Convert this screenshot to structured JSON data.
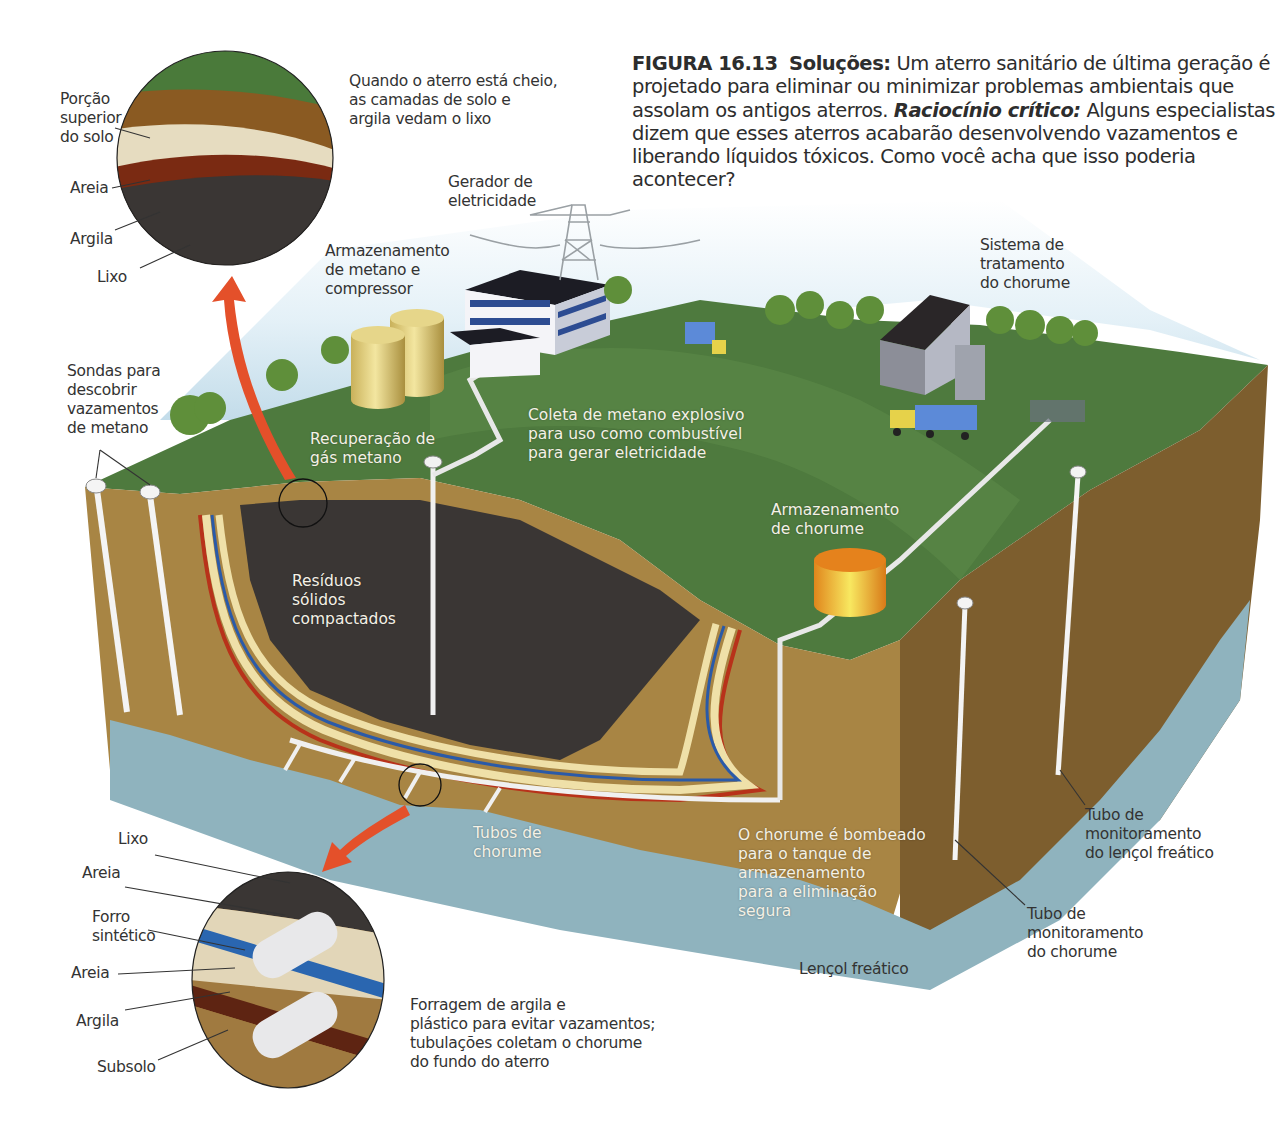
{
  "caption": {
    "figure_number": "FIGURA 16.13",
    "title": "Soluções:",
    "text_1": "Um aterro sanitário de última geração é projetado para eliminar ou minimizar problemas ambientais que assolam os antigos aterros.",
    "critical_label": "Raciocínio crítico:",
    "text_2": "Alguns especialistas dizem que esses aterros acabarão desenvolvendo vazamentos e liberando líquidos tóxicos. Como você acha que isso poderia acontecer?"
  },
  "top_inset": {
    "description": "Quando o aterro está cheio,\nas camadas de solo e\nargila vedam o lixo",
    "layers": [
      {
        "label": "Porção\nsuperior\ndo solo",
        "color": "#8a5a22"
      },
      {
        "label": "Areia",
        "color": "#e6dcc0"
      },
      {
        "label": "Argila",
        "color": "#7a2a12"
      },
      {
        "label": "Lixo",
        "color": "#3a3634"
      }
    ]
  },
  "bottom_inset": {
    "description": "Forragem de argila e\nplástico para evitar vazamentos;\ntubulações coletam o chorume\ndo fundo do aterro",
    "layers": [
      {
        "label": "Lixo",
        "color": "#3a3634"
      },
      {
        "label": "Areia",
        "color": "#e2d6b8"
      },
      {
        "label": "Forro\nsintético",
        "color": "#2a66b0"
      },
      {
        "label": "Areia",
        "color": "#e2d6b8"
      },
      {
        "label": "Argila",
        "color": "#5e2412"
      },
      {
        "label": "Subsolo",
        "color": "#a07a40"
      }
    ]
  },
  "labels": {
    "gerador": "Gerador de\neletricidade",
    "armazenamento_metano": "Armazenamento\nde metano e\ncompressor",
    "sistema_tratamento": "Sistema de\ntratamento\ndo chorume",
    "sondas": "Sondas para\ndescobrir\nvazamentos\nde metano",
    "recuperacao_gas": "Recuperação de\ngás metano",
    "coleta_metano": "Coleta de metano explosivo\npara uso como combustível\npara gerar eletricidade",
    "armazenamento_chorume": "Armazenamento\nde chorume",
    "residuos": "Resíduos\nsólidos\ncompactados",
    "tubos_chorume": "Tubos de\nchorume",
    "chorume_bombeado": "O chorume é bombeado\npara o tanque de\narmazenamento\npara a eliminação\nsegura",
    "lencol_freatico": "Lençol freático",
    "tubo_monitoramento_lencol": "Tubo de\nmonitoramento\ndo lençol freático",
    "tubo_monitoramento_chorume": "Tubo de\nmonitoramento\ndo chorume"
  },
  "colors": {
    "grass": "#4e7a3e",
    "soil": "#a88544",
    "soil_dark": "#7d5e2e",
    "waste": "#3a3634",
    "water": "#8fb3be",
    "arrow": "#e4502a",
    "liner_blue": "#2a5aa8",
    "liner_red": "#b8321a",
    "liner_sand": "#efe0a8"
  }
}
